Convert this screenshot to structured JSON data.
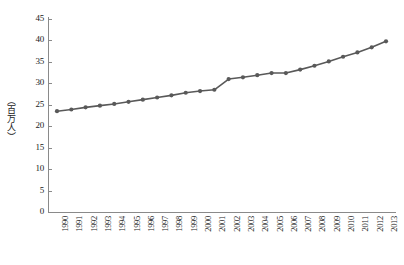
{
  "chart_data": {
    "type": "line",
    "title": "",
    "xlabel": "",
    "ylabel": "（百万人）",
    "ylim": [
      0,
      45
    ],
    "yticks": [
      0,
      5,
      10,
      15,
      20,
      25,
      30,
      35,
      40,
      45
    ],
    "grid": false,
    "legend": "none",
    "marker": "circle",
    "series_color": "#595959",
    "categories": [
      "1990",
      "1991",
      "1992",
      "1993",
      "1994",
      "1995",
      "1996",
      "1997",
      "1998",
      "1999",
      "2000",
      "2001",
      "2002",
      "2003",
      "2004",
      "2005",
      "2006",
      "2007",
      "2008",
      "2009",
      "2010",
      "2011",
      "2012",
      "2013"
    ],
    "series": [
      {
        "name": "人口",
        "values": [
          23.5,
          23.9,
          24.4,
          24.8,
          25.2,
          25.7,
          26.2,
          26.7,
          27.2,
          27.8,
          28.2,
          28.5,
          31.0,
          31.4,
          31.9,
          32.4,
          32.4,
          33.2,
          34.1,
          35.1,
          36.2,
          37.2,
          38.4,
          39.8
        ]
      }
    ]
  },
  "axes": {
    "y_title": "（百万人）"
  },
  "caption": {
    "text": ""
  }
}
